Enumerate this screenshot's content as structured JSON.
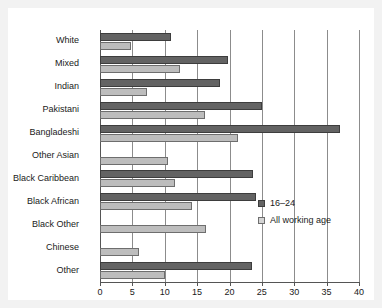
{
  "chart_data": {
    "type": "bar",
    "orientation": "horizontal",
    "title": "",
    "xlabel": "",
    "ylabel": "",
    "xlim": [
      0,
      40
    ],
    "xticks": [
      0,
      5,
      10,
      15,
      20,
      25,
      30,
      35,
      40
    ],
    "grid": true,
    "legend_position": "center-right",
    "categories": [
      "White",
      "Mixed",
      "Indian",
      "Pakistani",
      "Bangladeshi",
      "Other Asian",
      "Black Caribbean",
      "Black African",
      "Black Other",
      "Chinese",
      "Other"
    ],
    "series": [
      {
        "name": "16–24",
        "color": "#636363",
        "values": [
          11,
          19.8,
          18.6,
          25,
          37,
          null,
          23.7,
          24.1,
          null,
          null,
          23.4
        ]
      },
      {
        "name": "All working age",
        "color": "#bdbdbd",
        "values": [
          4.8,
          12.3,
          7.3,
          16.2,
          21.3,
          10.5,
          11.6,
          14.2,
          16.4,
          6,
          10
        ]
      }
    ]
  }
}
